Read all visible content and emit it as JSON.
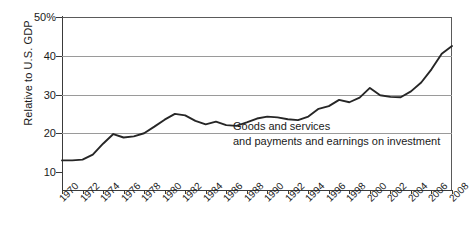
{
  "chart_data": {
    "type": "line",
    "title": "",
    "xlabel": "",
    "ylabel": "Relative to U.S. GDP",
    "ylim": [
      10,
      50
    ],
    "xlim": [
      1970,
      2008
    ],
    "grid": true,
    "legend": "none",
    "y_ticks": [
      10,
      20,
      30,
      40,
      50
    ],
    "y_tick_labels": [
      "10",
      "20",
      "30",
      "40",
      "50%"
    ],
    "x_ticks": [
      1970,
      1972,
      1974,
      1976,
      1978,
      1980,
      1982,
      1984,
      1986,
      1988,
      1990,
      1992,
      1994,
      1996,
      1998,
      2000,
      2002,
      2004,
      2006,
      2008
    ],
    "x_tick_labels": [
      "1970",
      "1972",
      "1974",
      "1976",
      "1978",
      "1980",
      "1982",
      "1984",
      "1986",
      "1988",
      "1990",
      "1992",
      "1994",
      "1996",
      "1998",
      "2000",
      "2002",
      "2004",
      "2006",
      "2008"
    ],
    "series": [
      {
        "name": "Goods and services and payments and earnings on investment",
        "color": "#262626",
        "x": [
          1970,
          1971,
          1972,
          1973,
          1974,
          1975,
          1976,
          1977,
          1978,
          1979,
          1980,
          1981,
          1982,
          1983,
          1984,
          1985,
          1986,
          1987,
          1988,
          1989,
          1990,
          1991,
          1992,
          1993,
          1994,
          1995,
          1996,
          1997,
          1998,
          1999,
          2000,
          2001,
          2002,
          2003,
          2004,
          2005,
          2006,
          2007,
          2008
        ],
        "values": [
          13.0,
          13.0,
          13.2,
          14.5,
          17.3,
          19.8,
          18.9,
          19.2,
          20.0,
          21.7,
          23.5,
          25.0,
          24.6,
          23.2,
          22.3,
          23.0,
          22.1,
          21.9,
          22.8,
          23.8,
          24.3,
          24.1,
          23.6,
          23.4,
          24.3,
          26.3,
          27.0,
          28.6,
          28.0,
          29.2,
          31.7,
          29.8,
          29.4,
          29.3,
          30.8,
          33.1,
          36.5,
          40.5,
          42.5
        ]
      }
    ],
    "annotations": [
      {
        "line1": "Goods and services",
        "line2": "and payments and earnings on investment"
      }
    ]
  }
}
